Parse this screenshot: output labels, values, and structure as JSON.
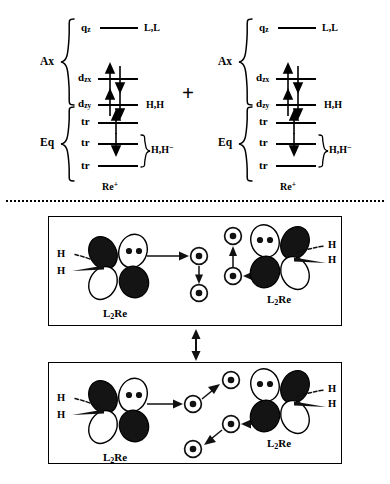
{
  "figure": {
    "type": "chemical-scheme",
    "title_present": false
  },
  "mo_section": {
    "plus_sign": "+",
    "diagrams": [
      {
        "id": "left",
        "groups": [
          {
            "name": "Ax",
            "label": "Ax"
          },
          {
            "name": "Eq",
            "label": "Eq"
          }
        ],
        "levels": [
          {
            "orbital": "q",
            "sub": "z",
            "electrons": "none",
            "occupancy_label": "L,L",
            "group": "Ax"
          },
          {
            "orbital": "d",
            "sub": "zx",
            "electrons": "pair",
            "occupancy_label": "",
            "group": "Ax"
          },
          {
            "orbital": "d",
            "sub": "zy",
            "electrons": "pair",
            "occupancy_label": "H,H",
            "group": "Ax"
          },
          {
            "orbital": "tr",
            "sub": "",
            "electrons": "up",
            "occupancy_label": "",
            "group": "Eq"
          },
          {
            "orbital": "tr",
            "sub": "",
            "electrons": "down",
            "occupancy_label": "",
            "group": "Eq"
          },
          {
            "orbital": "tr",
            "sub": "",
            "electrons": "none",
            "occupancy_label": "",
            "group": "Eq"
          }
        ],
        "bracket_label": "H,H",
        "bracket_label_sup": "−",
        "center_label": "Re",
        "center_label_sup": "+"
      },
      {
        "id": "right",
        "groups": [
          {
            "name": "Ax",
            "label": "Ax"
          },
          {
            "name": "Eq",
            "label": "Eq"
          }
        ],
        "levels": [
          {
            "orbital": "q",
            "sub": "z",
            "electrons": "none",
            "occupancy_label": "L,L",
            "group": "Ax"
          },
          {
            "orbital": "d",
            "sub": "zx",
            "electrons": "pair",
            "occupancy_label": "",
            "group": "Ax"
          },
          {
            "orbital": "d",
            "sub": "zy",
            "electrons": "pair",
            "occupancy_label": "H,H",
            "group": "Ax"
          },
          {
            "orbital": "tr",
            "sub": "",
            "electrons": "up",
            "occupancy_label": "",
            "group": "Eq"
          },
          {
            "orbital": "tr",
            "sub": "",
            "electrons": "down",
            "occupancy_label": "",
            "group": "Eq"
          },
          {
            "orbital": "tr",
            "sub": "",
            "electrons": "none",
            "occupancy_label": "",
            "group": "Eq"
          }
        ],
        "bracket_label": "H,H",
        "bracket_label_sup": "−",
        "center_label": "Re",
        "center_label_sup": "+"
      }
    ]
  },
  "resonance_section": {
    "resonance_arrow": "double-headed-vertical",
    "panels": [
      {
        "id": "top",
        "left_fragment": {
          "label": "L",
          "label_sub": "2",
          "label_rest": "Re",
          "h_labels": [
            "H",
            "H"
          ],
          "bond_styles": [
            "hashed",
            "wedge"
          ],
          "lone_pair_dots": 2
        },
        "right_fragment": {
          "label": "L",
          "label_sub": "2",
          "label_rest": "Re",
          "h_labels": [
            "H",
            "H"
          ],
          "bond_styles": [
            "hashed",
            "wedge"
          ],
          "lone_pair_dots": 2
        },
        "center_atoms": [
          {
            "id": "tl",
            "dot": true
          },
          {
            "id": "bl",
            "dot": true
          },
          {
            "id": "tr",
            "dot": true
          },
          {
            "id": "br",
            "dot": true
          }
        ],
        "arrows": [
          {
            "name": "left-to-center",
            "direction": "right"
          },
          {
            "name": "center-left-pair",
            "direction": "down"
          },
          {
            "name": "center-right-pair",
            "direction": "up"
          },
          {
            "name": "right-to-center",
            "direction": "left"
          }
        ]
      },
      {
        "id": "bottom",
        "left_fragment": {
          "label": "L",
          "label_sub": "2",
          "label_rest": "Re",
          "h_labels": [
            "H",
            "H"
          ],
          "bond_styles": [
            "hashed",
            "wedge"
          ],
          "lone_pair_dots": 2
        },
        "right_fragment": {
          "label": "L",
          "label_sub": "2",
          "label_rest": "Re",
          "h_labels": [
            "H",
            "H"
          ],
          "bond_styles": [
            "hashed",
            "wedge"
          ],
          "lone_pair_dots": 2
        },
        "center_atoms": [
          {
            "id": "l",
            "dot": true
          },
          {
            "id": "tr",
            "dot": true
          },
          {
            "id": "r",
            "dot": true
          },
          {
            "id": "bl",
            "dot": true
          }
        ],
        "arrows": [
          {
            "name": "left-to-center",
            "direction": "right"
          },
          {
            "name": "center-left-diagonal",
            "direction": "up-right"
          },
          {
            "name": "center-right-diagonal",
            "direction": "down-left"
          },
          {
            "name": "right-to-center",
            "direction": "left"
          }
        ]
      }
    ]
  },
  "colors": {
    "ink": "#000000",
    "background": "#ffffff",
    "lobe_filled": "#1a1a1a",
    "lobe_empty": "#ffffff"
  }
}
